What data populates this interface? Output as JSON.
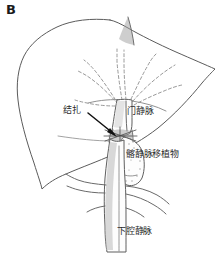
{
  "figure": {
    "panel_letter": "B",
    "language": "zh",
    "width": 224,
    "height": 255,
    "background_color": "#ffffff",
    "ink_color": "#5b5b5b",
    "text_color": "#2b2b2b",
    "arrow_color": "#111111"
  },
  "labels": {
    "ligation": "结扎",
    "portal_vein": "门静脉",
    "iliac_vein_graft": "髂静脉移植物",
    "inferior_vena_cava": "下腔静脉"
  },
  "annotations": [
    {
      "id": "ligation",
      "text": "结扎",
      "x": 63,
      "y": 106,
      "has_leader_arrow": true
    },
    {
      "id": "portal",
      "text": "门静脉",
      "x": 127,
      "y": 107,
      "has_leader_arrow": false
    },
    {
      "id": "graft",
      "text": "髂静脉移植物",
      "x": 126,
      "y": 150,
      "has_leader_arrow": false
    },
    {
      "id": "ivc",
      "text": "下腔静脉",
      "x": 117,
      "y": 227,
      "has_leader_arrow": false
    }
  ],
  "structures": [
    {
      "id": "liver",
      "name": "liver-outline",
      "style": "solid-outline"
    },
    {
      "id": "intrahepatic-portal",
      "name": "intrahepatic-portal-branches",
      "style": "dashed"
    },
    {
      "id": "portal-vein-trunk",
      "name": "portal-vein-trunk",
      "style": "solid-outline"
    },
    {
      "id": "ligature-site",
      "name": "ligature-constriction",
      "style": "shaded-narrowing"
    },
    {
      "id": "iliac-graft",
      "name": "iliac-vein-graft-conduit",
      "style": "stippled-loop"
    },
    {
      "id": "ivc-trunk",
      "name": "inferior-vena-cava-trunk",
      "style": "solid-shaded"
    },
    {
      "id": "hepatic-vein-stump",
      "name": "hepatic-vein-stump",
      "style": "shaded-triangle"
    }
  ]
}
